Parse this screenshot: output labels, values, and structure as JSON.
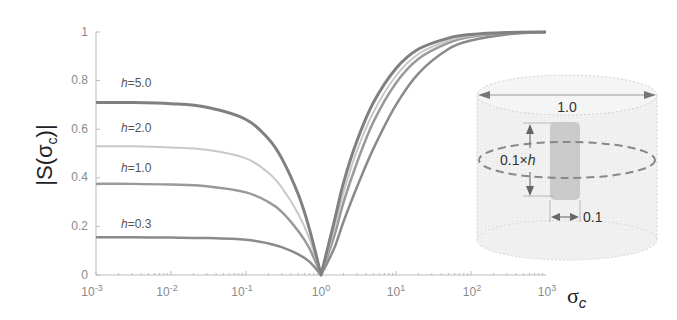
{
  "chart_data": {
    "type": "line",
    "title": "",
    "xlabel": "σc",
    "ylabel": "|S(σc)|",
    "xscale": "log",
    "xlim": [
      0.001,
      1000
    ],
    "ylim": [
      0,
      1
    ],
    "x_ticks": [
      "10^-3",
      "10^-2",
      "10^-1",
      "10^0",
      "10^1",
      "10^2",
      "10^3"
    ],
    "y_ticks": [
      "0",
      "0.2",
      "0.4",
      "0.6",
      "0.8",
      "1"
    ],
    "grid": false,
    "x": [
      0.001,
      0.003,
      0.01,
      0.03,
      0.1,
      0.2,
      0.3,
      0.5,
      0.7,
      1.0,
      1.5,
      2,
      3,
      5,
      10,
      20,
      50,
      100,
      300,
      1000
    ],
    "series": [
      {
        "name": "h=5.0",
        "color": "#808080",
        "width": 3,
        "values": [
          0.71,
          0.71,
          0.705,
          0.69,
          0.64,
          0.56,
          0.48,
          0.33,
          0.19,
          0.0,
          0.22,
          0.38,
          0.55,
          0.71,
          0.85,
          0.93,
          0.975,
          0.99,
          0.998,
          1.0
        ]
      },
      {
        "name": "h=2.0",
        "color": "#c8c8c8",
        "width": 2,
        "values": [
          0.53,
          0.53,
          0.525,
          0.515,
          0.48,
          0.42,
          0.36,
          0.25,
          0.15,
          0.0,
          0.19,
          0.34,
          0.51,
          0.67,
          0.82,
          0.91,
          0.965,
          0.985,
          0.997,
          1.0
        ]
      },
      {
        "name": "h=1.0",
        "color": "#999999",
        "width": 2.5,
        "values": [
          0.375,
          0.375,
          0.372,
          0.365,
          0.34,
          0.3,
          0.26,
          0.18,
          0.11,
          0.0,
          0.16,
          0.3,
          0.46,
          0.63,
          0.79,
          0.89,
          0.955,
          0.98,
          0.995,
          1.0
        ]
      },
      {
        "name": "h=0.3",
        "color": "#8a8a8a",
        "width": 2.5,
        "values": [
          0.155,
          0.155,
          0.154,
          0.152,
          0.145,
          0.13,
          0.115,
          0.085,
          0.055,
          0.0,
          0.11,
          0.22,
          0.36,
          0.52,
          0.7,
          0.83,
          0.93,
          0.965,
          0.99,
          1.0
        ]
      }
    ],
    "annotations": [
      {
        "text": "h=5.0",
        "x": 0.003,
        "y": 0.78
      },
      {
        "text": "h=2.0",
        "x": 0.003,
        "y": 0.59
      },
      {
        "text": "h=1.0",
        "x": 0.003,
        "y": 0.43
      },
      {
        "text": "h=0.3",
        "x": 0.003,
        "y": 0.22
      }
    ],
    "inset": {
      "description": "cylinder schematic",
      "outer_diameter_label": "1.0",
      "height_label": "0.1×h",
      "inner_width_label": "0.1"
    }
  },
  "axis": {
    "ylabel_main": "|S(σ",
    "ylabel_sub": "c",
    "ylabel_end": ")|",
    "xlabel_main": "σ",
    "xlabel_sub": "c",
    "x_ticks": [
      {
        "base": "10",
        "exp": "-3"
      },
      {
        "base": "10",
        "exp": "-2"
      },
      {
        "base": "10",
        "exp": "-1"
      },
      {
        "base": "10",
        "exp": "0"
      },
      {
        "base": "10",
        "exp": "1"
      },
      {
        "base": "10",
        "exp": "2"
      },
      {
        "base": "10",
        "exp": "3"
      }
    ],
    "y_ticks": [
      "0",
      "0.2",
      "0.4",
      "0.6",
      "0.8",
      "1"
    ]
  },
  "labels": {
    "h5": "h=5.0",
    "h2": "h=2.0",
    "h1": "h=1.0",
    "h03": "h=0.3"
  },
  "inset": {
    "diameter": "1.0",
    "height_prefix": "0.1×",
    "height_var": "h",
    "width": "0.1"
  }
}
